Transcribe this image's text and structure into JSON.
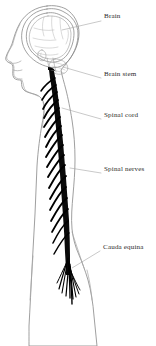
{
  "figure": {
    "background_color": "#ffffff",
    "ink_color": "#000000",
    "outline_color": "#8e8e8e",
    "label_color": "#2b2b2b",
    "leader_color": "#9c9c9c"
  },
  "labels": [
    {
      "id": "brain",
      "text": "Brain",
      "x": 104,
      "y": 16,
      "leader_from_x": 101,
      "leader_from_y": 21,
      "leader_to_x": 62,
      "leader_to_y": 30
    },
    {
      "id": "brain-stem",
      "text": "Brain stem",
      "x": 104,
      "y": 74,
      "leader_from_x": 101,
      "leader_from_y": 78,
      "leader_to_x": 63,
      "leader_to_y": 67
    },
    {
      "id": "spinal-cord",
      "text": "Spinal cord",
      "x": 104,
      "y": 115,
      "leader_from_x": 101,
      "leader_from_y": 119,
      "leader_to_x": 62,
      "leader_to_y": 108
    },
    {
      "id": "spinal-nerves",
      "text": "Spinal nerves",
      "x": 104,
      "y": 169,
      "leader_from_x": 101,
      "leader_from_y": 173,
      "leader_to_x": 70,
      "leader_to_y": 168
    },
    {
      "id": "cauda-equina",
      "text": "Cauda equina",
      "x": 103,
      "y": 246,
      "leader_from_x": 100,
      "leader_from_y": 251,
      "leader_to_x": 72,
      "leader_to_y": 268
    }
  ],
  "anatomy": {
    "body_outline_label": "body-silhouette",
    "skull_label": "skull-outline",
    "brain_label": "brain-outline",
    "cord_label": "spinal-cord-shape",
    "nerve_count": 17,
    "cauda_fiber_count": 9
  }
}
